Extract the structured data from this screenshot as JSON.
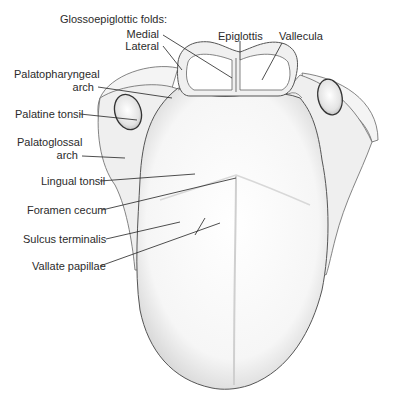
{
  "labels": {
    "glossoepiglottic_folds": "Glossoepiglottic folds:",
    "medial": "Medial",
    "lateral": "Lateral",
    "epiglottis": "Epiglottis",
    "vallecula": "Vallecula",
    "palatopharyngeal_arch_1": "Palatopharyngeal",
    "palatopharyngeal_arch_2": "arch",
    "palatine_tonsil": "Palatine tonsil",
    "palatoglossal_arch_1": "Palatoglossal",
    "palatoglossal_arch_2": "arch",
    "lingual_tonsil": "Lingual tonsil",
    "foramen_cecum": "Foramen cecum",
    "sulcus_terminalis": "Sulcus terminalis",
    "vallate_papillae": "Vallate papillae"
  },
  "colors": {
    "outline": "#555555",
    "leader": "#222222",
    "shade": "#d9d9d9",
    "text": "#2b2b2b"
  }
}
